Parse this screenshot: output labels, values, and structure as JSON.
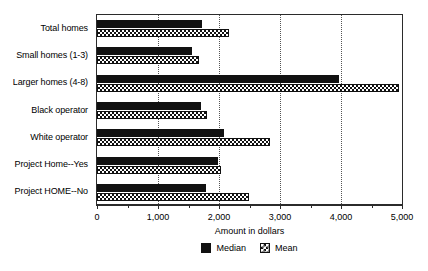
{
  "chart_data": {
    "type": "bar",
    "orientation": "horizontal",
    "title": "",
    "xlabel": "Amount in dollars",
    "ylabel": "",
    "xlim": [
      0,
      5000
    ],
    "xticks": [
      0,
      1000,
      2000,
      3000,
      4000,
      5000
    ],
    "xtick_labels": [
      "0",
      "1,000",
      "2,000",
      "3,000",
      "4,000",
      "5,000"
    ],
    "minor_tick_step": 500,
    "grid": "vertical dotted at 1,000 2,000 3,000 4,000",
    "legend_position": "bottom-center",
    "categories": [
      "Total homes",
      "Small homes (1-3)",
      "Larger homes (4-8)",
      "Black operator",
      "White operator",
      "Project Home--Yes",
      "Project HOME--No"
    ],
    "series": [
      {
        "name": "Median",
        "color": "#111111",
        "pattern": "solid",
        "values": [
          1720,
          1560,
          3970,
          1700,
          2080,
          1980,
          1780
        ]
      },
      {
        "name": "Mean",
        "color": "#ffffff",
        "pattern": "cross-hatch",
        "values": [
          2160,
          1670,
          4950,
          1800,
          2840,
          2030,
          2490
        ]
      }
    ]
  },
  "legend": {
    "items": [
      {
        "label": "Median",
        "swatch": "solid-black-square-icon"
      },
      {
        "label": "Mean",
        "swatch": "crosshatch-square-icon"
      }
    ]
  },
  "axis": {
    "x_title": "Amount in dollars"
  },
  "colors": {
    "median": "#111111",
    "mean_fill": "#ffffff",
    "outline": "#2b2b2b",
    "gridline": "#555555",
    "background": "#ffffff"
  }
}
